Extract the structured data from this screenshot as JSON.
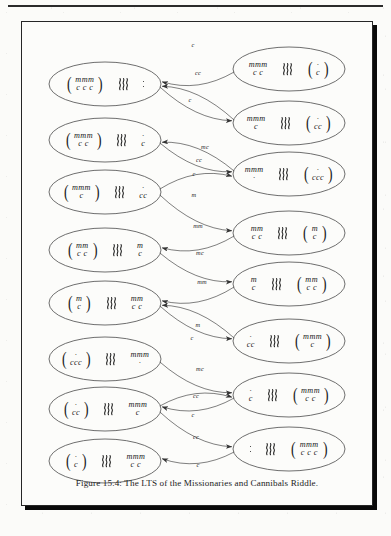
{
  "figure": {
    "caption": "Figure 15.4: The LTS of the Missionaries and Cannibals Riddle.",
    "river_icon": "river-waves-icon",
    "empty_icon": "empty-bank-dots-icon"
  },
  "chart_data": {
    "type": "diagram",
    "title": "The LTS of the Missionaries and Cannibals Riddle",
    "layout": "two-column labelled transition system",
    "node_notation": {
      "m": "missionary",
      "c": "cannibal",
      "river": "three wavy vertical lines separating the two banks",
      "dots": "vertical dots denote an empty bank",
      "parentheses": "enclose the bank where the boat currently is"
    },
    "alphabet": [
      "c",
      "cc",
      "m",
      "mm",
      "mc"
    ],
    "nodes": [
      {
        "id": "L1",
        "column": "left",
        "boat": "left",
        "left_top": "mmm",
        "left_bottom": "c c c",
        "right_top": "",
        "right_bottom": "",
        "right_empty": true,
        "left_empty": false
      },
      {
        "id": "L2",
        "column": "left",
        "boat": "left",
        "left_top": "mmm",
        "left_bottom": "c c",
        "right_top": "·",
        "right_bottom": "c",
        "right_empty": false,
        "left_empty": false
      },
      {
        "id": "L3",
        "column": "left",
        "boat": "left",
        "left_top": "mmm",
        "left_bottom": "c",
        "right_top": "·",
        "right_bottom": "cc",
        "right_empty": false,
        "left_empty": false
      },
      {
        "id": "L4",
        "column": "left",
        "boat": "left",
        "left_top": "mm",
        "left_bottom": "c c",
        "right_top": "m",
        "right_bottom": "c",
        "right_empty": false,
        "left_empty": false
      },
      {
        "id": "L5",
        "column": "left",
        "boat": "left",
        "left_top": "m",
        "left_bottom": "c",
        "right_top": "mm",
        "right_bottom": "c c",
        "right_empty": false,
        "left_empty": false
      },
      {
        "id": "L6",
        "column": "left",
        "boat": "left",
        "left_top": "·",
        "left_bottom": "ccc",
        "right_top": "mmm",
        "right_bottom": "·",
        "right_empty": false,
        "left_empty": false
      },
      {
        "id": "L7",
        "column": "left",
        "boat": "left",
        "left_top": "·",
        "left_bottom": "cc",
        "right_top": "mmm",
        "right_bottom": "c",
        "right_empty": false,
        "left_empty": false
      },
      {
        "id": "L8",
        "column": "left",
        "boat": "left",
        "left_top": "·",
        "left_bottom": "c",
        "right_top": "mmm",
        "right_bottom": "c c",
        "right_empty": false,
        "left_empty": false
      },
      {
        "id": "R1",
        "column": "right",
        "boat": "right",
        "left_top": "mmm",
        "left_bottom": "c c",
        "right_top": "·",
        "right_bottom": "c",
        "right_empty": false,
        "left_empty": false
      },
      {
        "id": "R2",
        "column": "right",
        "boat": "right",
        "left_top": "mmm",
        "left_bottom": "c",
        "right_top": "·",
        "right_bottom": "cc",
        "right_empty": false,
        "left_empty": false
      },
      {
        "id": "R3",
        "column": "right",
        "boat": "right",
        "left_top": "mmm",
        "left_bottom": "·",
        "right_top": "·",
        "right_bottom": "ccc",
        "right_empty": false,
        "left_empty": false
      },
      {
        "id": "R4",
        "column": "right",
        "boat": "right",
        "left_top": "mm",
        "left_bottom": "c c",
        "right_top": "m",
        "right_bottom": "c",
        "right_empty": false,
        "left_empty": false
      },
      {
        "id": "R5",
        "column": "right",
        "boat": "right",
        "left_top": "m",
        "left_bottom": "c",
        "right_top": "mm",
        "right_bottom": "c c",
        "right_empty": false,
        "left_empty": false
      },
      {
        "id": "R6",
        "column": "right",
        "boat": "right",
        "left_top": "·",
        "left_bottom": "cc",
        "right_top": "mmm",
        "right_bottom": "c",
        "right_empty": false,
        "left_empty": false
      },
      {
        "id": "R7",
        "column": "right",
        "boat": "right",
        "left_top": "·",
        "left_bottom": "c",
        "right_top": "mmm",
        "right_bottom": "c c",
        "right_empty": false,
        "left_empty": false
      },
      {
        "id": "R8",
        "column": "right",
        "boat": "right",
        "left_top": "",
        "left_bottom": "",
        "right_top": "mmm",
        "right_bottom": "c c c",
        "right_empty": false,
        "left_empty": true
      }
    ],
    "edges": [
      {
        "from": "R1",
        "to": "L1",
        "label": "c",
        "lx": 193,
        "ly": 44
      },
      {
        "from": "R2",
        "to": "L1",
        "label": "cc",
        "lx": 198,
        "ly": 72
      },
      {
        "from": "L1",
        "to": "R2",
        "label": "c",
        "lx": 190,
        "ly": 99
      },
      {
        "from": "L2",
        "to": "R3",
        "label": "mc",
        "lx": 205,
        "ly": 146
      },
      {
        "from": "L3",
        "to": "R3",
        "label": "cc",
        "lx": 199,
        "ly": 159
      },
      {
        "from": "R3",
        "to": "L2",
        "label": "c",
        "lx": 194,
        "ly": 173
      },
      {
        "from": "L3",
        "to": "R4",
        "label": "m",
        "lx": 194,
        "ly": 194
      },
      {
        "from": "R4",
        "to": "L4",
        "label": "mm",
        "lx": 198,
        "ly": 225
      },
      {
        "from": "L4",
        "to": "R5",
        "label": "mc",
        "lx": 200,
        "ly": 252
      },
      {
        "from": "R5",
        "to": "L5",
        "label": "mm",
        "lx": 202,
        "ly": 281
      },
      {
        "from": "L5",
        "to": "R6",
        "label": "m",
        "lx": 198,
        "ly": 324
      },
      {
        "from": "R6",
        "to": "L5",
        "label": "c",
        "lx": 192,
        "ly": 337
      },
      {
        "from": "L6",
        "to": "R7",
        "label": "mc",
        "lx": 200,
        "ly": 368
      },
      {
        "from": "L7",
        "to": "R7",
        "label": "cc",
        "lx": 196,
        "ly": 395
      },
      {
        "from": "R7",
        "to": "L7",
        "label": "c",
        "lx": 193,
        "ly": 414
      },
      {
        "from": "L7",
        "to": "R8",
        "label": "cc",
        "lx": 196,
        "ly": 436
      },
      {
        "from": "R8",
        "to": "L8",
        "label": "c",
        "lx": 198,
        "ly": 464
      }
    ]
  }
}
